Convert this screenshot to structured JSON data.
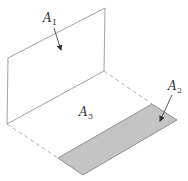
{
  "figure": {
    "labels": {
      "a1": {
        "main": "A",
        "sub": "1"
      },
      "a2": {
        "main": "A",
        "sub": "2"
      },
      "a3": {
        "main": "A",
        "sub": "3"
      }
    },
    "colors": {
      "line": "#8a8a8a",
      "dashed": "#a0a0a0",
      "shade_fill": "#c4c4c4",
      "shade_edge": "#7a7a7a",
      "arrow": "#333333",
      "background": "#ffffff"
    }
  }
}
